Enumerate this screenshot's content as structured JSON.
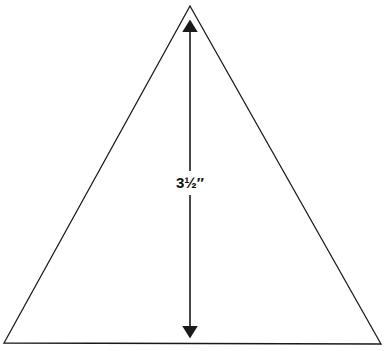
{
  "diagram": {
    "shape": "equilateral-triangle",
    "height_label": "3½″",
    "colors": {
      "stroke": "#1a1a1a",
      "background": "#ffffff"
    }
  }
}
